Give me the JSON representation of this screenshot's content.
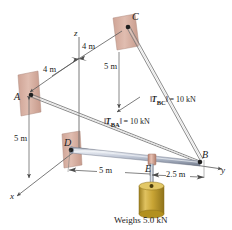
{
  "figure": {
    "caption": "Weighs 5.0 kN"
  },
  "points": {
    "a": "A",
    "b": "B",
    "c": "C",
    "d": "D",
    "e": "E"
  },
  "axes": {
    "x": "x",
    "y": "y",
    "z": "z"
  },
  "dimensions": {
    "c_to_z_4m": "4 m",
    "a_to_z_4m": "4 m",
    "c_drop_5m": "5 m",
    "a_drop_5m": "5 m",
    "d_to_e_5m": "5 m",
    "e_to_b_2_5m": "2.5 m"
  },
  "forces": {
    "tba": {
      "symbol": "T",
      "subscript": "BA",
      "equals": "= 10 kN",
      "magnitude": 10,
      "unit": "kN"
    },
    "tbc": {
      "symbol": "T",
      "subscript": "BC",
      "equals": "= 10 kN",
      "magnitude": 10,
      "unit": "kN"
    }
  },
  "load": {
    "caption": "Weighs 5.0 kN",
    "weight": 5.0,
    "unit": "kN"
  },
  "colors": {
    "wall_plate": "#d9b3a6",
    "wall_plate_dark": "#c49a8c",
    "boom_body": "#b9c0cf",
    "boom_dark": "#7b8496",
    "boom_light": "#e3e7ee",
    "cylinder": "#c8a434",
    "cylinder_light": "#ddbd58",
    "cylinder_dark": "#9c7e1f",
    "collar": "#d9a999",
    "line": "#555555",
    "text": "#1a1a1a"
  }
}
